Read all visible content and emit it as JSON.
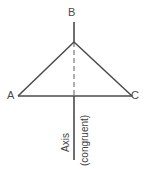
{
  "diagram": {
    "type": "isosceles-triangle-with-axis-of-symmetry",
    "background_color": "#ffffff",
    "stroke_color": "#4a4a4a",
    "dashed_stroke_color": "#9a9a9a",
    "vertices": {
      "apex_label": "B",
      "left_label": "A",
      "right_label": "C"
    },
    "axis": {
      "label": "Axis",
      "note": "(congruent)"
    },
    "geometry": {
      "apex": {
        "x": 74,
        "y": 42
      },
      "left": {
        "x": 18,
        "y": 96
      },
      "right": {
        "x": 132,
        "y": 96
      },
      "axis_top": {
        "x": 74,
        "y": 22
      },
      "axis_bottom": {
        "x": 74,
        "y": 160
      },
      "base_y": 96
    }
  }
}
